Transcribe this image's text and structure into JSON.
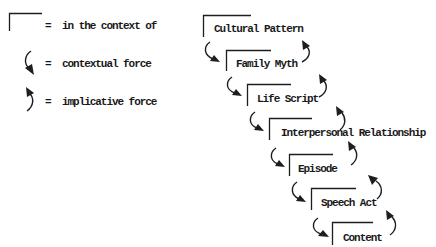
{
  "legend": {
    "items": [
      {
        "symbol": "context-bracket",
        "equals": "=",
        "label": "in the context of"
      },
      {
        "symbol": "contextual-force-arrow",
        "equals": "=",
        "label": "contextual force"
      },
      {
        "symbol": "implicative-force-arrow",
        "equals": "=",
        "label": "implicative force"
      }
    ]
  },
  "hierarchy": {
    "levels": [
      {
        "label": "Cultural Pattern"
      },
      {
        "label": "Family Myth"
      },
      {
        "label": "Life Script"
      },
      {
        "label": "Interpersonal Relationship"
      },
      {
        "label": "Episode"
      },
      {
        "label": "Speech Act"
      },
      {
        "label": "Content"
      }
    ],
    "contextual_force_links": [
      {
        "from": "Cultural Pattern",
        "to": "Family Myth"
      },
      {
        "from": "Family Myth",
        "to": "Life Script"
      },
      {
        "from": "Life Script",
        "to": "Interpersonal Relationship"
      },
      {
        "from": "Interpersonal Relationship",
        "to": "Episode"
      },
      {
        "from": "Episode",
        "to": "Speech Act"
      },
      {
        "from": "Speech Act",
        "to": "Content"
      }
    ],
    "implicative_force_links": [
      {
        "from": "Family Myth",
        "to": "Cultural Pattern"
      },
      {
        "from": "Life Script",
        "to": "Family Myth"
      },
      {
        "from": "Interpersonal Relationship",
        "to": "Life Script"
      },
      {
        "from": "Episode",
        "to": "Interpersonal Relationship"
      },
      {
        "from": "Speech Act",
        "to": "Episode"
      },
      {
        "from": "Content",
        "to": "Speech Act"
      }
    ]
  }
}
